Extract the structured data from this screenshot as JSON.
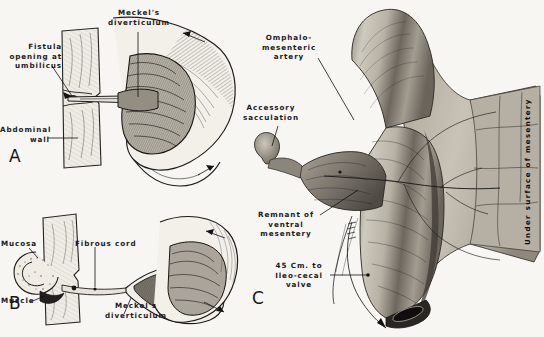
{
  "figure": {
    "background_color": "#f7f6f3",
    "ink_color": "#1a1a1a",
    "panels": [
      {
        "id": "A",
        "letter": "A",
        "caption_summary": "Meckel's diverticulum with patent fistula opening at the umbilicus through the abdominal wall, opened bowel showing mucosal folds",
        "labels": [
          {
            "name": "meckels-diverticulum",
            "text": "Meckel's\ndiverticulum"
          },
          {
            "name": "fistula-opening",
            "text": "Fistula\nopening at\numbilicus"
          },
          {
            "name": "abdominal-wall",
            "text": "Abdominal\nwall"
          }
        ]
      },
      {
        "id": "B",
        "letter": "B",
        "caption_summary": "Meckel's diverticulum connected to the umbilicus by a fibrous cord; mucosa and muscle layers shown at the umbilical end",
        "labels": [
          {
            "name": "mucosa",
            "text": "Mucosa"
          },
          {
            "name": "muscle",
            "text": "Muscle"
          },
          {
            "name": "fibrous-cord",
            "text": "Fibrous cord"
          },
          {
            "name": "meckels-diverticulum",
            "text": "Meckel's\ndiverticulum"
          }
        ]
      },
      {
        "id": "C",
        "letter": "C",
        "caption_summary": "Specimen photograph showing the under surface of the mesentery with omphalomesenteric artery, accessory sacculation and remnant of ventral mesentery",
        "labels": [
          {
            "name": "omphalomesenteric-artery",
            "text": "Omphalo-\nmesenteric\nartery"
          },
          {
            "name": "accessory-sacculation",
            "text": "Accessory\nsacculation"
          },
          {
            "name": "remnant-ventral-mesentery",
            "text": "Remnant of\nventral\nmesentery"
          },
          {
            "name": "ileocecal-distance",
            "text": "45 Cm. to\nIleo-cecal\nvalve"
          },
          {
            "name": "under-surface-mesentery",
            "text": "Under surface of mesentery"
          }
        ]
      }
    ]
  }
}
